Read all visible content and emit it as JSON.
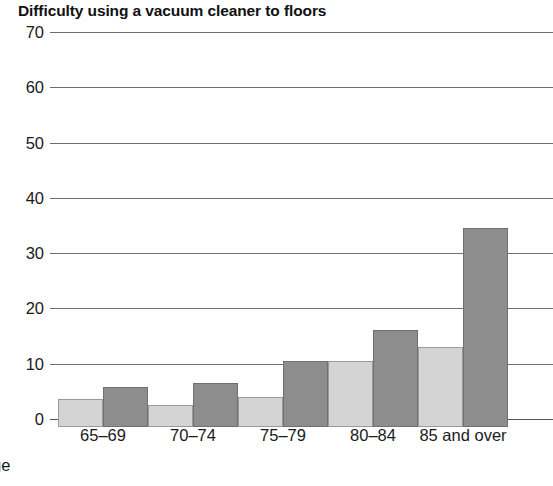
{
  "chart_data": {
    "type": "bar",
    "title": "Difficulty using a vacuum cleaner to floors",
    "xlabel": "Age",
    "ylabel": "",
    "categories": [
      "65–69",
      "70–74",
      "75–79",
      "80–84",
      "85 and over"
    ],
    "series": [
      {
        "name": "series-light",
        "color": "#d4d4d4",
        "values": [
          5,
          4,
          5.5,
          12,
          14.5
        ]
      },
      {
        "name": "series-dark",
        "color": "#8d8d8d",
        "values": [
          7.2,
          8,
          12,
          17.5,
          36
        ]
      }
    ],
    "ylim": [
      0,
      70
    ],
    "ytick_labels": [
      "70",
      "60",
      "50",
      "40",
      "30",
      "20",
      "10",
      "0"
    ],
    "ytick_values": [
      70,
      60,
      50,
      40,
      30,
      20,
      10,
      0
    ],
    "ytick_step": 10,
    "grid": true,
    "legend": "none",
    "legend_position": "none"
  },
  "axis": {
    "x_caption_visible_text": "ge",
    "x_caption_full": "Age"
  }
}
